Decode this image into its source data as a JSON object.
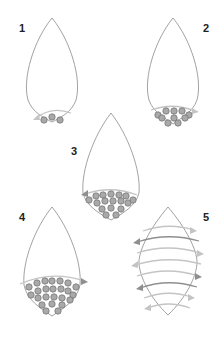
{
  "diagram": {
    "steps": [
      {
        "label": "1",
        "description": "Start: 3 beads at the tip, thread passes right to left"
      },
      {
        "label": "2",
        "description": "Second row: 4 beads added, thread passes left to right"
      },
      {
        "label": "3",
        "description": "Third row: 5 beads added, thread passes right to left"
      },
      {
        "label": "4",
        "description": "Fourth row: 6 beads added, thread passes left to right"
      },
      {
        "label": "5",
        "description": "Continue weaving back and forth across the full leaf shape"
      }
    ],
    "colors": {
      "outline": "#8a8a8a",
      "bead_fill": "#a9a9a9",
      "bead_stroke": "#6e6e6e",
      "thread_light": "#c4c4c4",
      "thread_dark": "#8f8f8f",
      "label": "#222222",
      "background": "#ffffff"
    }
  }
}
